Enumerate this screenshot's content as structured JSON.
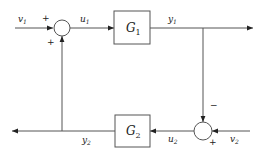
{
  "diagram": {
    "type": "block-diagram",
    "colors": {
      "line": "#555555",
      "text": "#222222",
      "background": "#ffffff"
    },
    "blocks": [
      {
        "id": "G1",
        "label": "G",
        "subscript": "1"
      },
      {
        "id": "G2",
        "label": "G",
        "subscript": "2"
      }
    ],
    "summing_junctions": [
      {
        "id": "sum1",
        "signs": {
          "left": "+",
          "bottom": "+"
        }
      },
      {
        "id": "sum2",
        "signs": {
          "top": "−",
          "bottom_right": "+"
        }
      }
    ],
    "signals": {
      "v1": {
        "base": "v",
        "sub": "1"
      },
      "u1": {
        "base": "u",
        "sub": "1"
      },
      "y1": {
        "base": "y",
        "sub": "1"
      },
      "v2": {
        "base": "v",
        "sub": "2"
      },
      "u2": {
        "base": "u",
        "sub": "2"
      },
      "y2": {
        "base": "y",
        "sub": "2"
      }
    }
  }
}
